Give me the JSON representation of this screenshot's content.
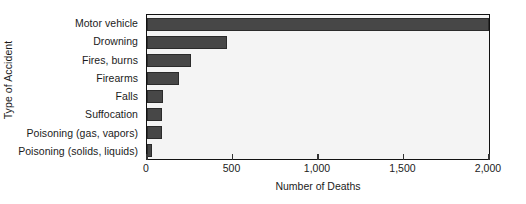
{
  "chart_data": {
    "type": "bar",
    "orientation": "horizontal",
    "title": "",
    "xlabel": "Number of Deaths",
    "ylabel": "Type of Accident",
    "categories": [
      "Motor vehicle",
      "Drowning",
      "Fires, burns",
      "Firearms",
      "Falls",
      "Suffocation",
      "Poisoning (gas, vapors)",
      "Poisoning (solids, liquids)"
    ],
    "values": [
      2000,
      465,
      255,
      185,
      95,
      85,
      90,
      30
    ],
    "xlim": [
      0,
      2000
    ],
    "xticks": [
      0,
      500,
      1000,
      1500,
      2000
    ],
    "xtick_labels": [
      "0",
      "500",
      "1,000",
      "1,500",
      "2,000"
    ],
    "grid": false,
    "legend": null,
    "bar_color": "#474747",
    "plot_background": "#f4f4f4",
    "frame_color": "#111111"
  }
}
